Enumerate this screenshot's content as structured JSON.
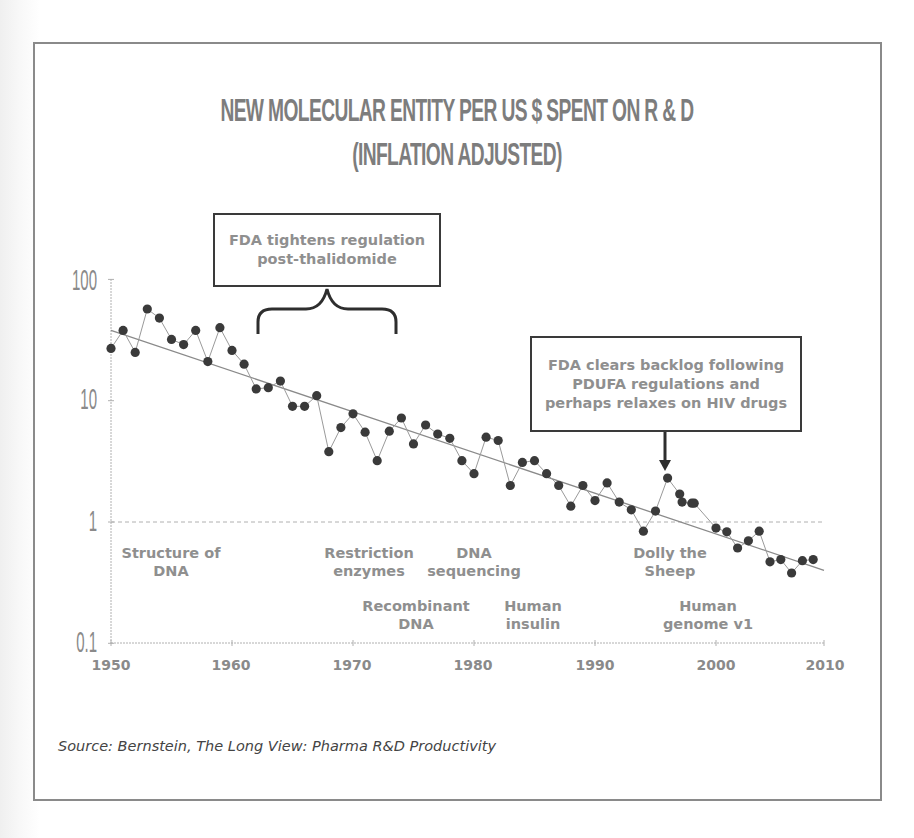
{
  "chart_data": {
    "type": "line",
    "title": "NEW MOLECULAR ENTITY PER US $ SPENT ON R & D",
    "subtitle": "(INFLATION ADJUSTED)",
    "xlabel": "",
    "ylabel": "",
    "y_scale": "log",
    "ylim": [
      0.1,
      100
    ],
    "xlim": [
      1950,
      2010
    ],
    "grid": false,
    "reference_line": {
      "y": 1,
      "style": "dashed"
    },
    "x_ticks": [
      "1950",
      "1960",
      "1970",
      "1980",
      "1990",
      "2000",
      "2010"
    ],
    "y_ticks": [
      "100",
      "10",
      "1",
      "0.1"
    ],
    "series": [
      {
        "name": "NMEs per US$ R&D (inflation adjusted)",
        "style": "line+markers",
        "x": [
          1950,
          1951,
          1952,
          1953,
          1954,
          1955,
          1956,
          1957,
          1958,
          1959,
          1960,
          1961,
          1962,
          1963,
          1964,
          1965,
          1966,
          1967,
          1968,
          1969,
          1970,
          1971,
          1972,
          1973,
          1974,
          1975,
          1976,
          1977,
          1978,
          1979,
          1980,
          1981,
          1982,
          1983,
          1984,
          1985,
          1986,
          1987,
          1988,
          1989,
          1990,
          1991,
          1992,
          1993,
          1994,
          1995,
          1996,
          1997,
          1997.2,
          1998,
          1998.2,
          2000,
          2001,
          2002,
          2003,
          2004,
          2005,
          2006,
          2007,
          2008,
          2009
        ],
        "values": [
          27,
          38,
          25,
          57,
          48,
          32,
          29,
          38,
          21,
          40,
          26,
          20,
          12.5,
          12.8,
          14.5,
          9,
          9,
          11,
          3.8,
          6,
          7.8,
          5.5,
          3.2,
          5.6,
          7.2,
          4.4,
          6.3,
          5.3,
          4.9,
          3.2,
          2.5,
          5.0,
          4.7,
          2.0,
          3.1,
          3.2,
          2.5,
          2.0,
          1.35,
          2.0,
          1.5,
          2.1,
          1.46,
          1.26,
          0.84,
          1.23,
          2.3,
          1.7,
          1.46,
          1.43,
          1.43,
          0.89,
          0.83,
          0.61,
          0.7,
          0.84,
          0.47,
          0.49,
          0.38,
          0.48,
          0.49
        ]
      },
      {
        "name": "Trend (exponential fit)",
        "style": "line",
        "x": [
          1950,
          2010
        ],
        "values": [
          38,
          0.4
        ]
      }
    ],
    "annotations": [
      {
        "text": "Structure of DNA",
        "year": 1953
      },
      {
        "text": "Restriction enzymes",
        "year": 1970
      },
      {
        "text": "Recombinant DNA",
        "year": 1973
      },
      {
        "text": "DNA sequencing",
        "year": 1977
      },
      {
        "text": "Human insulin",
        "year": 1982
      },
      {
        "text": "Dolly the Sheep",
        "year": 1996
      },
      {
        "text": "Human genome v1",
        "year": 2000
      },
      {
        "text": "FDA tightens regulation post-thalidomide",
        "year_range": [
          1962,
          1974
        ],
        "type": "brace-callout"
      },
      {
        "text": "FDA clears backlog following PDUFA regulations and perhaps relaxes on HIV drugs",
        "year": 1996,
        "type": "arrow-callout"
      }
    ],
    "source": "Source: Bernstein, The Long View: Pharma R&D Productivity"
  },
  "title": {
    "line1": "NEW MOLECULAR ENTITY PER US $ SPENT ON R & D",
    "line2": "(INFLATION ADJUSTED)"
  },
  "y_axis": {
    "t100": "100",
    "t10": "10",
    "t1": "1",
    "t01": "0.1"
  },
  "x_axis": {
    "t1950": "1950",
    "t1960": "1960",
    "t1970": "1970",
    "t1980": "1980",
    "t1990": "1990",
    "t2000": "2000",
    "t2010": "2010"
  },
  "events": {
    "dna_structure": {
      "l1": "Structure of",
      "l2": "DNA"
    },
    "restriction": {
      "l1": "Restriction",
      "l2": "enzymes"
    },
    "sequencing": {
      "l1": "DNA",
      "l2": "sequencing"
    },
    "recombinant": {
      "l1": "Recombinant",
      "l2": "DNA"
    },
    "insulin": {
      "l1": "Human",
      "l2": "insulin"
    },
    "dolly": {
      "l1": "Dolly the",
      "l2": "Sheep"
    },
    "genome": {
      "l1": "Human",
      "l2": "genome v1"
    }
  },
  "callouts": {
    "fda_tighten": {
      "l1": "FDA tightens regulation",
      "l2": "post-thalidomide"
    },
    "fda_clears": {
      "l1": "FDA clears backlog following",
      "l2": "PDUFA regulations and",
      "l3": "perhaps relaxes on HIV drugs"
    }
  },
  "source": "Source: Bernstein, The Long View: Pharma R&D Productivity",
  "colors": {
    "marker": "#3a3a3a",
    "line": "#9a9a9a",
    "trend": "#8a8a8a",
    "text": "#8a8a8a",
    "frame": "#8a8a8a"
  }
}
